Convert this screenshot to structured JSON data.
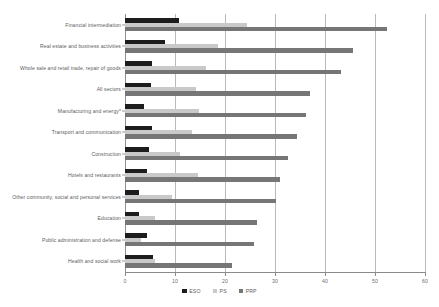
{
  "chart_data": {
    "type": "bar",
    "orientation": "horizontal",
    "title": "",
    "subtitle": "",
    "xlabel": "",
    "ylabel": "",
    "xlim": [
      0,
      60
    ],
    "xticks": [
      0,
      10,
      20,
      30,
      40,
      50,
      60
    ],
    "grid": true,
    "legend_position": "bottom",
    "categories": [
      "Financial intermediation",
      "Real estate and business activities",
      "Whole sale and retail trade, repair of goods",
      "All sectors",
      "Manufacturing and energy*",
      "Transport and communication",
      "Construction",
      "Hotels and restaurants",
      "Other community, social and personal services",
      "Education",
      "Public administration and defense",
      "Health and social work"
    ],
    "series": [
      {
        "name": "ESO",
        "color": "#1d1d1d",
        "values": [
          10.8,
          8.0,
          5.4,
          5.2,
          3.8,
          5.4,
          4.8,
          4.4,
          2.8,
          2.8,
          4.4,
          5.6
        ]
      },
      {
        "name": "PS",
        "color": "#c9c9c9",
        "values": [
          24.4,
          18.6,
          16.2,
          14.2,
          14.8,
          13.4,
          11.0,
          14.6,
          9.4,
          6.0,
          3.2,
          6.0
        ]
      },
      {
        "name": "PRP",
        "color": "#767676",
        "values": [
          52.4,
          45.6,
          43.2,
          37.0,
          36.2,
          34.4,
          32.6,
          31.0,
          30.2,
          26.4,
          25.8,
          21.4
        ]
      }
    ]
  },
  "legend": {
    "items": [
      {
        "label": "ESO",
        "swatch": "legend-swatch-eso"
      },
      {
        "label": "PS",
        "swatch": "legend-swatch-ps"
      },
      {
        "label": "PRP",
        "swatch": "legend-swatch-prp"
      }
    ]
  }
}
